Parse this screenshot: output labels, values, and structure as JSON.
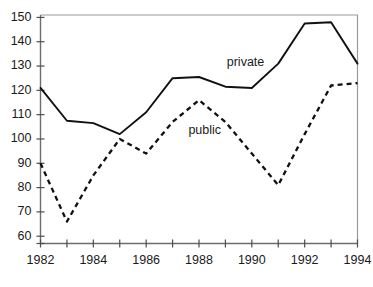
{
  "chart_data": {
    "type": "line",
    "title": "",
    "subtitle": "",
    "xlabel": "",
    "ylabel": "",
    "x": [
      1982,
      1983,
      1984,
      1985,
      1986,
      1987,
      1988,
      1989,
      1990,
      1991,
      1992,
      1993,
      1994
    ],
    "xlim": [
      1982,
      1994
    ],
    "ylim": [
      57,
      151
    ],
    "y_ticks": [
      60,
      70,
      80,
      90,
      100,
      110,
      120,
      130,
      140,
      150
    ],
    "y_tick_labels": [
      "60",
      "70",
      "80",
      "90",
      "100",
      "110",
      "120",
      "130",
      "140",
      "150"
    ],
    "x_ticks": [
      1982,
      1983,
      1984,
      1985,
      1986,
      1987,
      1988,
      1989,
      1990,
      1991,
      1992,
      1993,
      1994
    ],
    "x_tick_labels": [
      "1982",
      "",
      "1984",
      "",
      "1986",
      "",
      "1988",
      "",
      "1990",
      "",
      "1992",
      "",
      "1994"
    ],
    "x_labelled_ticks": [
      1982,
      1984,
      1986,
      1988,
      1990,
      1992,
      1994
    ],
    "grid": false,
    "legend_position": "inline-annotation",
    "series": [
      {
        "name": "private",
        "style": "solid",
        "color": "#111111",
        "label": "private",
        "label_x": 1989.05,
        "label_y": 131.5,
        "values": [
          121,
          107.5,
          106.5,
          102,
          111,
          125,
          125.5,
          121.5,
          121,
          131,
          147.5,
          148,
          131
        ]
      },
      {
        "name": "public",
        "style": "dashed",
        "color": "#111111",
        "label": "public",
        "label_x": 1987.6,
        "label_y": 103.5,
        "values": [
          90,
          66,
          85,
          100,
          94,
          107,
          116,
          107,
          94,
          81,
          102,
          122,
          123
        ]
      }
    ],
    "annotations": [
      {
        "text": "private",
        "x": 1989.05,
        "y": 131.5
      },
      {
        "text": "public",
        "x": 1987.6,
        "y": 103.5
      }
    ]
  }
}
